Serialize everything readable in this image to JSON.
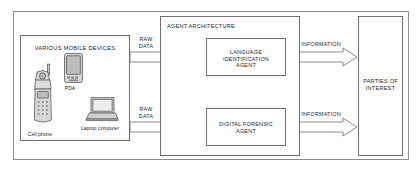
{
  "diagram": {
    "groups": {
      "devices": {
        "label": "VARIOUS MOBILE DEVICES"
      },
      "agent_architecture": {
        "label": "AGENT ARCHITECTURE"
      },
      "parties": {
        "label": "PARTIES OF\nINTEREST"
      }
    },
    "agents": [
      {
        "id": "language-identification-agent",
        "label": "LANGUAGE\nIDENTIFICATION\nAGENT"
      },
      {
        "id": "digital-forensic-agent",
        "label": "DIGITAL FORENSIC\nAGENT"
      }
    ],
    "devices": [
      {
        "id": "cell-phone",
        "caption": "Cell phone",
        "icon": "cell-phone-icon"
      },
      {
        "id": "pda",
        "caption": "PDA",
        "icon": "pda-icon"
      },
      {
        "id": "laptop-computer",
        "caption": "Laptop computer",
        "icon": "laptop-icon"
      }
    ],
    "flows": [
      {
        "id": "raw-data-top",
        "label": "RAW\nDATA",
        "from": "devices",
        "to": "language-identification-agent"
      },
      {
        "id": "raw-data-bottom",
        "label": "RAW\nDATA",
        "from": "devices",
        "to": "digital-forensic-agent"
      },
      {
        "id": "information-top",
        "label": "INFORMATION",
        "from": "language-identification-agent",
        "to": "parties"
      },
      {
        "id": "information-bottom",
        "label": "INFORMATION",
        "from": "digital-forensic-agent",
        "to": "parties"
      },
      {
        "id": "agent-link",
        "label": "",
        "from": "language-identification-agent",
        "to": "digital-forensic-agent"
      }
    ],
    "colors": {
      "stroke": "#6e6e6e",
      "frame": "#8d8d8d",
      "text": "#2b2b2b",
      "background": "#ffffff",
      "device_fill": "#d7d7d7"
    }
  }
}
